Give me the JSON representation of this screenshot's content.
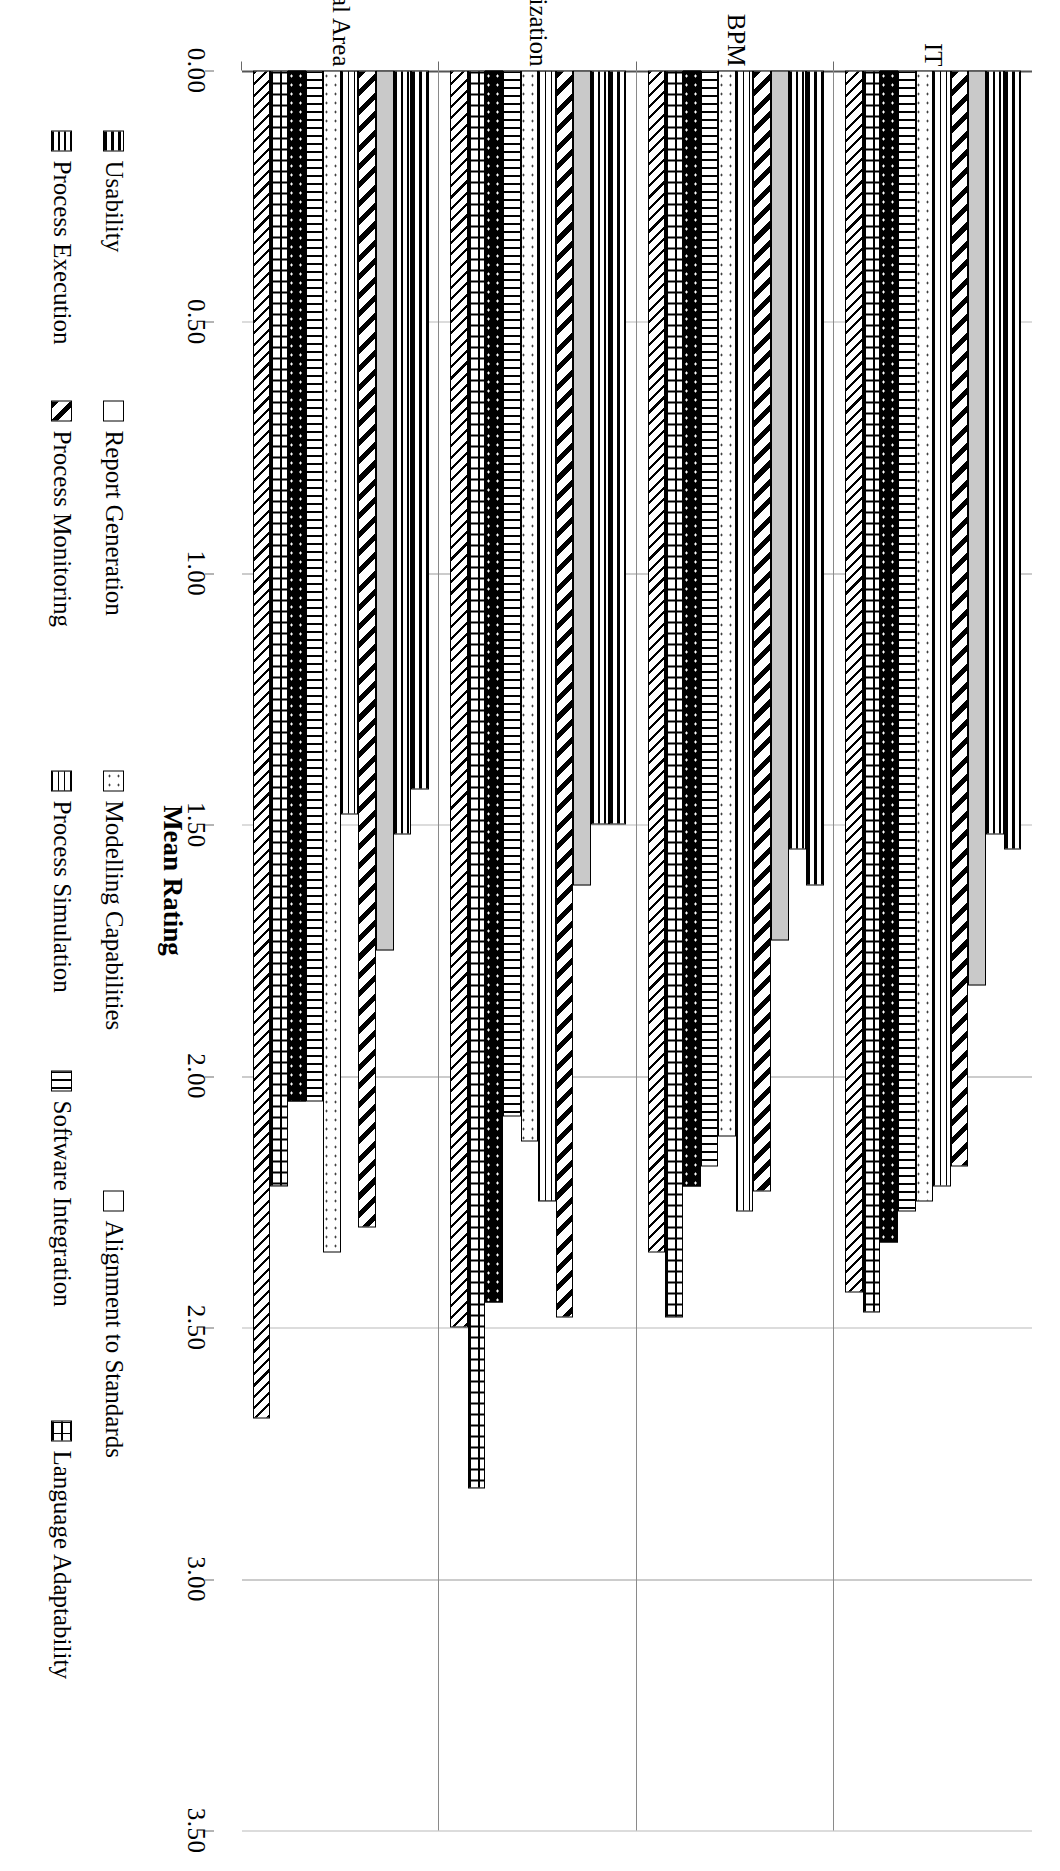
{
  "chart_data": {
    "type": "bar",
    "orientation": "vertical-clustered",
    "title": "",
    "xlabel": "",
    "ylabel": "Mean Rating",
    "ylim": [
      0.0,
      3.5
    ],
    "yticks": [
      "0.00",
      "0.50",
      "1.00",
      "1.50",
      "2.00",
      "2.50",
      "3.00",
      "3.50"
    ],
    "ytick_values": [
      0.0,
      0.5,
      1.0,
      1.5,
      2.0,
      2.5,
      3.0,
      3.5
    ],
    "grid": true,
    "legend_position": "bottom",
    "categories": [
      "IT",
      "BPM",
      "Company Organization",
      "Functional Area"
    ],
    "series": [
      {
        "name": "Usability",
        "pattern": "horizontal-bars",
        "values": [
          1.55,
          1.62,
          1.5,
          1.43
        ]
      },
      {
        "name": "Process Execution",
        "pattern": "thin-horizontal",
        "values": [
          1.52,
          1.55,
          1.5,
          1.52
        ]
      },
      {
        "name": "Report Generation",
        "pattern": "light-grey-solid",
        "values": [
          1.82,
          1.73,
          1.62,
          1.75
        ]
      },
      {
        "name": "Process Monitoring",
        "pattern": "wide-diagonal",
        "values": [
          2.18,
          2.23,
          2.48,
          2.3
        ]
      },
      {
        "name": "Process Simulation",
        "pattern": "fine-grid",
        "values": [
          2.22,
          2.27,
          2.25,
          1.48
        ]
      },
      {
        "name": "Modelling Capabilities",
        "pattern": "sparse-dots",
        "values": [
          2.25,
          2.12,
          2.13,
          2.35
        ]
      },
      {
        "name": "Software Integration",
        "pattern": "vertical-lines",
        "values": [
          2.27,
          2.18,
          2.08,
          2.05
        ]
      },
      {
        "name": "Alignment to Standards",
        "pattern": "dots-on-black",
        "values": [
          2.33,
          2.22,
          2.45,
          2.05
        ]
      },
      {
        "name": "Language Adaptability",
        "pattern": "brick-weave",
        "values": [
          2.47,
          2.48,
          2.82,
          2.22
        ]
      },
      {
        "name": "",
        "pattern": "fine-diagonal",
        "values": [
          2.43,
          2.35,
          2.5,
          2.68
        ]
      }
    ]
  },
  "legend": {
    "row1": [
      {
        "label": "Usability",
        "pattern": "horizontal-bars"
      },
      {
        "label": "Report Generation",
        "pattern": "light-grey-solid"
      },
      {
        "label": "Modelling Capabilities",
        "pattern": "sparse-dots"
      },
      {
        "label": "Alignment to Standards",
        "pattern": "dots-on-black"
      }
    ],
    "row2": [
      {
        "label": "Process Execution",
        "pattern": "thin-horizontal"
      },
      {
        "label": "Process Monitoring",
        "pattern": "wide-diagonal"
      },
      {
        "label": "Process Simulation",
        "pattern": "fine-grid"
      },
      {
        "label": "Software Integration",
        "pattern": "vertical-lines"
      },
      {
        "label": "Language Adaptability",
        "pattern": "brick-weave"
      }
    ]
  },
  "colors": {
    "ink": "#000000",
    "grid": "#b9b9b9",
    "grey_fill": "#c9c9c9",
    "background": "#ffffff"
  }
}
